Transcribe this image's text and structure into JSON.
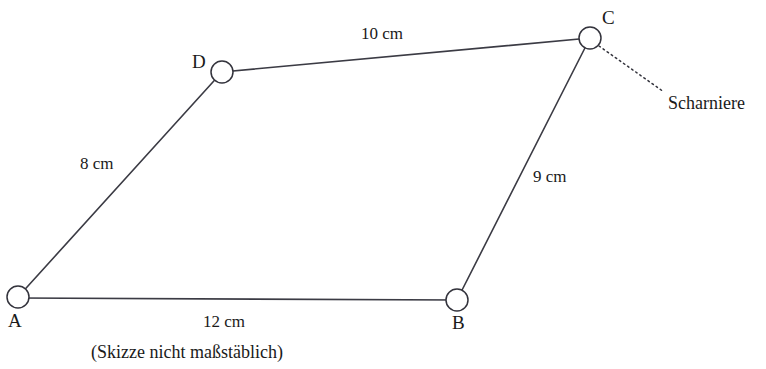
{
  "figure": {
    "note": "(Skizze nicht maßstäblich)",
    "callout": {
      "label": "Scharniere",
      "x": 668,
      "y": 94
    },
    "colors": {
      "background": "#ffffff",
      "line": "#3b3b44",
      "text": "#1a1a1a",
      "vertex_fill": "#ffffff"
    },
    "vertices": [
      {
        "id": "A",
        "label": "A",
        "cx": 18,
        "cy": 297,
        "r": 11,
        "label_x": 8,
        "label_y": 311
      },
      {
        "id": "B",
        "label": "B",
        "cx": 457,
        "cy": 300,
        "r": 11,
        "label_x": 452,
        "label_y": 313
      },
      {
        "id": "C",
        "label": "C",
        "cx": 590,
        "cy": 38,
        "r": 11,
        "label_x": 602,
        "label_y": 8
      },
      {
        "id": "D",
        "label": "D",
        "cx": 222,
        "cy": 72,
        "r": 11,
        "label_x": 192,
        "label_y": 52
      }
    ],
    "edges": [
      {
        "id": "AB",
        "from": "A",
        "to": "B",
        "label": "12 cm",
        "label_x": 203,
        "label_y": 313
      },
      {
        "id": "BC",
        "from": "B",
        "to": "C",
        "label": "9 cm",
        "label_x": 533,
        "label_y": 168
      },
      {
        "id": "DC",
        "from": "D",
        "to": "C",
        "label": "10 cm",
        "label_x": 361,
        "label_y": 25
      },
      {
        "id": "AD",
        "from": "A",
        "to": "D",
        "label": "8 cm",
        "label_x": 80,
        "label_y": 155
      }
    ],
    "hinge_leader": {
      "x1": 599,
      "y1": 46,
      "x2": 664,
      "y2": 92
    },
    "note_position": {
      "x": 91,
      "y": 343
    }
  }
}
